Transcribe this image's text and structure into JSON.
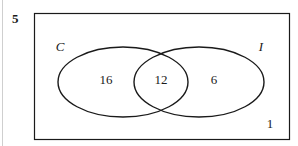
{
  "figure": {
    "question_number": "5",
    "type": "venn-diagram",
    "sets_count": 2,
    "universal_set": {
      "name": "universal-set-rectangle",
      "outside_value": "1",
      "border_color": "#1a1a1a"
    },
    "sets": [
      {
        "id": "C",
        "label": "C",
        "label_position": "outside-upper-left",
        "only_value": "16"
      },
      {
        "id": "I",
        "label": "I",
        "label_position": "outside-upper-right",
        "only_value": "6"
      }
    ],
    "regions": [
      {
        "name": "C-only",
        "value": "16"
      },
      {
        "name": "C-and-I",
        "value": "12"
      },
      {
        "name": "I-only",
        "value": "6"
      },
      {
        "name": "outside-both",
        "value": "1"
      }
    ],
    "colors": {
      "ink": "#1a1a1a",
      "background": "#ffffff",
      "page_rule": "#cfcfcf"
    }
  }
}
